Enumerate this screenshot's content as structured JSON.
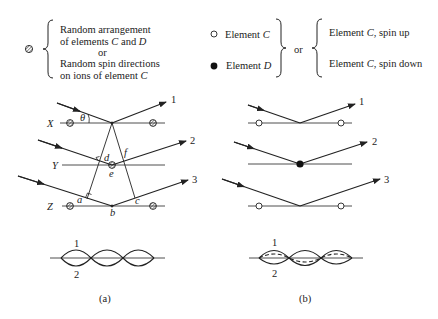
{
  "legend": {
    "left": {
      "symbol": "hatched-circle",
      "lines": [
        "Random arrangement",
        "of elements ",
        "or",
        "Random spin directions",
        "on ions of element "
      ],
      "line2_C": "C",
      "line2_and": " and ",
      "line2_D": "D",
      "line5_C": "C"
    },
    "middle": {
      "items": [
        {
          "symbol": "open-circle",
          "prefix": "Element ",
          "var": "C"
        },
        {
          "symbol": "filled-circle",
          "prefix": "Element ",
          "var": "D"
        }
      ],
      "or_label": "or"
    },
    "right": {
      "items": [
        {
          "prefix": "Element ",
          "var": "C",
          "suffix": ", spin up"
        },
        {
          "prefix": "Element ",
          "var": "C",
          "suffix": ", spin down"
        }
      ]
    }
  },
  "panel_a": {
    "caption": "(a)",
    "planes": [
      "X",
      "Y",
      "Z"
    ],
    "rays": [
      "1",
      "2",
      "3"
    ],
    "angle_label": "θ",
    "points": {
      "a": "a",
      "b": "b",
      "c": "c",
      "d": "d",
      "e": "e",
      "f": "f"
    },
    "wave_labels": [
      "1",
      "2"
    ]
  },
  "panel_b": {
    "caption": "(b)",
    "rays": [
      "1",
      "2",
      "3"
    ],
    "wave_labels": [
      "1",
      "2"
    ]
  },
  "colors": {
    "line": "#222222",
    "background": "#ffffff"
  }
}
